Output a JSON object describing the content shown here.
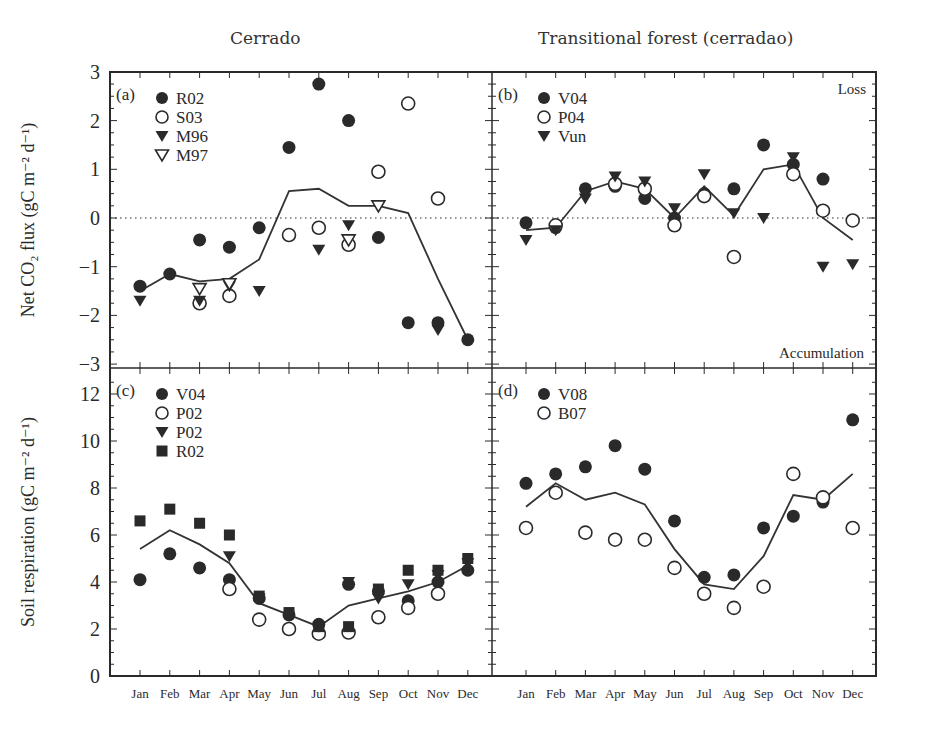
{
  "titles": {
    "left": "Cerrado",
    "right": "Transitional forest (cerradao)"
  },
  "axes": {
    "top_ylabel": "Net CO2 flux (gC m-2 d-1)",
    "bottom_ylabel": "Soil respiration (gC m-2 d-1)",
    "months": [
      "Jan",
      "Feb",
      "Mar",
      "Apr",
      "May",
      "Jun",
      "Jul",
      "Aug",
      "Sep",
      "Oct",
      "Nov",
      "Dec"
    ]
  },
  "annotations": {
    "loss": "Loss",
    "accumulation": "Accumulation"
  },
  "chart_data": [
    {
      "panel": "(a)",
      "type": "scatter",
      "title": "Cerrado",
      "xlabel": "",
      "ylabel": "Net CO2 flux (gC m-2 d-1)",
      "ylim": [
        -3,
        3
      ],
      "yticks": [
        -3,
        -2,
        -1,
        0,
        1,
        2,
        3
      ],
      "zero_line": "dotted",
      "categories": [
        "Jan",
        "Feb",
        "Mar",
        "Apr",
        "May",
        "Jun",
        "Jul",
        "Aug",
        "Sep",
        "Oct",
        "Nov",
        "Dec"
      ],
      "legend_position": "upper-left",
      "series": [
        {
          "name": "R02",
          "marker": "filled-circle",
          "values": [
            -1.4,
            -1.15,
            -0.45,
            -0.6,
            -0.2,
            1.45,
            2.75,
            2.0,
            -0.4,
            -2.15,
            -2.15,
            -2.5
          ]
        },
        {
          "name": "S03",
          "marker": "open-circle",
          "values": [
            null,
            null,
            -1.75,
            -1.6,
            null,
            -0.35,
            -0.2,
            -0.55,
            0.95,
            2.35,
            0.4,
            null
          ]
        },
        {
          "name": "M96",
          "marker": "filled-triangle-down",
          "values": [
            -1.7,
            null,
            -1.7,
            -1.4,
            -1.5,
            null,
            -0.65,
            -0.15,
            null,
            null,
            -2.3,
            null
          ]
        },
        {
          "name": "M97",
          "marker": "open-triangle-down",
          "values": [
            null,
            null,
            -1.45,
            -1.35,
            null,
            null,
            null,
            -0.45,
            0.25,
            null,
            null,
            null
          ]
        },
        {
          "name": "Mean",
          "marker": "line",
          "values": [
            -1.5,
            -1.15,
            -1.3,
            -1.25,
            -0.85,
            0.55,
            0.6,
            0.25,
            0.25,
            0.1,
            -1.25,
            -2.5
          ]
        }
      ]
    },
    {
      "panel": "(b)",
      "type": "scatter",
      "title": "Transitional forest (cerradao)",
      "ylim": [
        -3,
        3
      ],
      "zero_line": "dotted",
      "categories": [
        "Jan",
        "Feb",
        "Mar",
        "Apr",
        "May",
        "Jun",
        "Jul",
        "Aug",
        "Sep",
        "Oct",
        "Nov",
        "Dec"
      ],
      "legend_position": "upper-left",
      "annotations": [
        "Loss",
        "Accumulation"
      ],
      "series": [
        {
          "name": "V04",
          "marker": "filled-circle",
          "values": [
            -0.1,
            -0.2,
            0.6,
            0.65,
            0.4,
            0.0,
            0.5,
            0.6,
            1.5,
            1.1,
            0.8,
            null
          ]
        },
        {
          "name": "P04",
          "marker": "open-circle",
          "values": [
            null,
            -0.15,
            null,
            0.7,
            0.6,
            -0.15,
            0.45,
            -0.8,
            null,
            0.9,
            0.15,
            -0.05
          ]
        },
        {
          "name": "Vun",
          "marker": "filled-triangle-down",
          "values": [
            -0.45,
            -0.25,
            0.4,
            0.85,
            0.75,
            0.2,
            0.9,
            0.1,
            0.0,
            1.25,
            -1.0,
            -0.95
          ]
        },
        {
          "name": "Mean",
          "marker": "line",
          "values": [
            -0.25,
            -0.2,
            0.55,
            0.75,
            0.6,
            0.0,
            0.65,
            0.05,
            1.0,
            1.1,
            0.0,
            -0.45
          ]
        }
      ]
    },
    {
      "panel": "(c)",
      "type": "scatter",
      "ylabel": "Soil respiration (gC m-2 d-1)",
      "ylim": [
        0,
        12.5
      ],
      "yticks": [
        0,
        2,
        4,
        6,
        8,
        10,
        12
      ],
      "categories": [
        "Jan",
        "Feb",
        "Mar",
        "Apr",
        "May",
        "Jun",
        "Jul",
        "Aug",
        "Sep",
        "Oct",
        "Nov",
        "Dec"
      ],
      "legend_position": "upper-left",
      "series": [
        {
          "name": "V04",
          "marker": "filled-circle",
          "values": [
            4.1,
            5.2,
            4.6,
            4.1,
            3.3,
            2.6,
            2.2,
            3.9,
            3.6,
            3.2,
            4.0,
            4.5
          ]
        },
        {
          "name": "P02",
          "marker": "open-circle",
          "values": [
            null,
            null,
            null,
            3.7,
            2.4,
            2.0,
            1.8,
            1.85,
            2.5,
            2.9,
            3.5,
            null
          ]
        },
        {
          "name": "P02",
          "marker": "filled-triangle-down",
          "values": [
            null,
            null,
            null,
            5.1,
            3.3,
            null,
            2.1,
            4.0,
            3.3,
            3.9,
            4.3,
            4.8
          ]
        },
        {
          "name": "R02",
          "marker": "filled-square",
          "values": [
            6.6,
            7.1,
            6.5,
            6.0,
            3.4,
            2.7,
            2.1,
            2.1,
            3.7,
            4.5,
            4.5,
            5.0
          ]
        },
        {
          "name": "Mean",
          "marker": "line",
          "values": [
            5.4,
            6.2,
            5.6,
            4.8,
            3.1,
            2.6,
            2.1,
            3.0,
            3.3,
            3.6,
            4.0,
            4.7
          ]
        }
      ]
    },
    {
      "panel": "(d)",
      "type": "scatter",
      "ylim": [
        0,
        12.5
      ],
      "categories": [
        "Jan",
        "Feb",
        "Mar",
        "Apr",
        "May",
        "Jun",
        "Jul",
        "Aug",
        "Sep",
        "Oct",
        "Nov",
        "Dec"
      ],
      "legend_position": "upper-left",
      "series": [
        {
          "name": "V08",
          "marker": "filled-circle",
          "values": [
            8.2,
            8.6,
            8.9,
            9.8,
            8.8,
            6.6,
            4.2,
            4.3,
            6.3,
            6.8,
            7.4,
            10.9
          ]
        },
        {
          "name": "B07",
          "marker": "open-circle",
          "values": [
            6.3,
            7.8,
            6.1,
            5.8,
            5.8,
            4.6,
            3.5,
            2.9,
            3.8,
            8.6,
            7.6,
            6.3
          ]
        },
        {
          "name": "Mean",
          "marker": "line",
          "values": [
            7.2,
            8.2,
            7.5,
            7.8,
            7.3,
            5.4,
            3.9,
            3.7,
            5.1,
            7.7,
            7.5,
            8.6
          ]
        }
      ]
    }
  ],
  "colors": {
    "ink": "#2a2a2a",
    "background": "#ffffff"
  }
}
